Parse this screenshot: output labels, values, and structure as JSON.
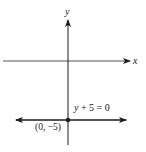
{
  "diagram": {
    "axes": {
      "x_label": "x",
      "y_label": "y"
    },
    "line": {
      "equation": "y + 5 = 0",
      "equation_var": "y",
      "equation_rest": " + 5 = 0"
    },
    "point": {
      "label": "(0, −5)"
    },
    "colors": {
      "ink": "#1a1a1a",
      "axis": "#555555",
      "background": "#ffffff"
    }
  }
}
